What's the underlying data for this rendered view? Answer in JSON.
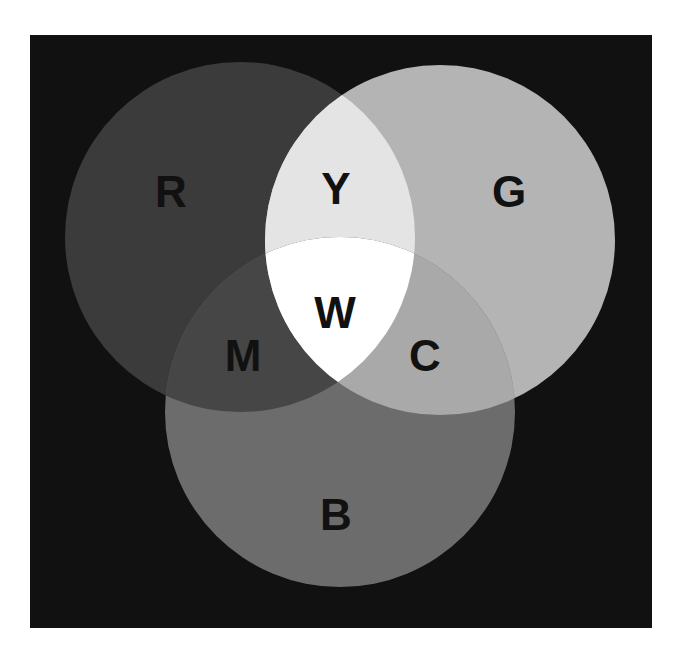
{
  "diagram": {
    "type": "venn",
    "title": "",
    "colors": {
      "page_background": "#ffffff",
      "panel_background": "#111111",
      "label_color": "#111111"
    },
    "circles": [
      {
        "id": "R",
        "label": "R",
        "cx": 240,
        "cy": 237,
        "r": 175,
        "fill": "#3b3b3b"
      },
      {
        "id": "G",
        "label": "G",
        "cx": 440,
        "cy": 240,
        "r": 175,
        "fill": "#b4b4b4"
      },
      {
        "id": "B",
        "label": "B",
        "cx": 340,
        "cy": 412,
        "r": 175,
        "fill": "#6c6c6c"
      }
    ],
    "overlaps": {
      "RG": {
        "label": "Y",
        "fill": "#e4e4e4"
      },
      "RB": {
        "label": "M",
        "fill": "#464646"
      },
      "GB": {
        "label": "C",
        "fill": "#a9a9a9"
      },
      "RGB": {
        "label": "W",
        "fill": "#ffffff"
      }
    },
    "labels": [
      {
        "text": "R",
        "x": 171,
        "y": 191,
        "size": 44
      },
      {
        "text": "Y",
        "x": 336,
        "y": 188,
        "size": 44
      },
      {
        "text": "G",
        "x": 509,
        "y": 191,
        "size": 44
      },
      {
        "text": "W",
        "x": 335,
        "y": 312,
        "size": 44
      },
      {
        "text": "M",
        "x": 243,
        "y": 355,
        "size": 44
      },
      {
        "text": "C",
        "x": 425,
        "y": 355,
        "size": 44
      },
      {
        "text": "B",
        "x": 336,
        "y": 514,
        "size": 44
      }
    ]
  }
}
